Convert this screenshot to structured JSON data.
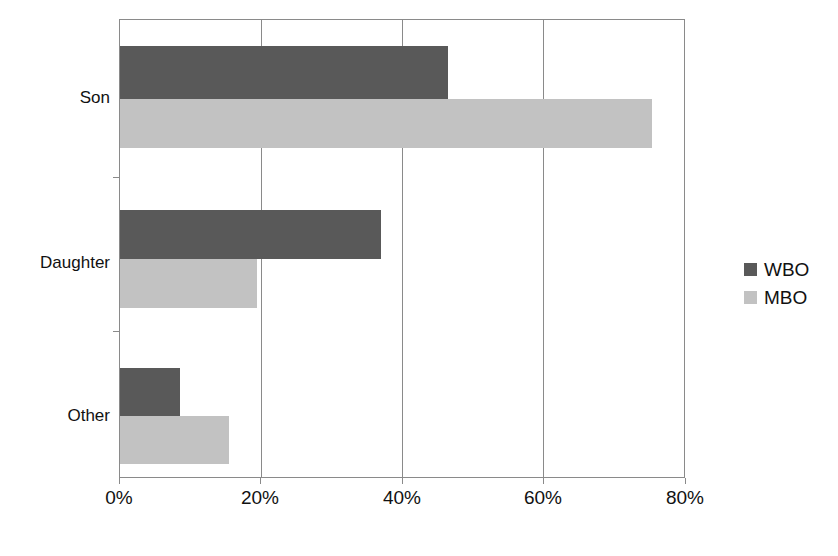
{
  "chart_data": {
    "type": "bar",
    "orientation": "horizontal",
    "title": "",
    "subtitle": "",
    "xlabel": "",
    "ylabel": "",
    "categories": [
      "Son",
      "Daughter",
      "Other"
    ],
    "series": [
      {
        "name": "WBO",
        "color": "#595959",
        "values": [
          46.5,
          37.0,
          8.5
        ]
      },
      {
        "name": "MBO",
        "color": "#c2c2c2",
        "values": [
          75.5,
          19.5,
          15.5
        ]
      }
    ],
    "xticks": [
      "0%",
      "20%",
      "40%",
      "60%",
      "80%"
    ],
    "xtick_values": [
      0,
      20,
      40,
      60,
      80
    ],
    "xlim": [
      0,
      80
    ],
    "grid": "vertical",
    "legend_position": "right",
    "value_suffix": "%"
  },
  "legend": {
    "items": [
      {
        "label": "WBO",
        "swatch": "legend-swatch-wbo"
      },
      {
        "label": "MBO",
        "swatch": "legend-swatch-mbo"
      }
    ]
  },
  "axis": {
    "category_labels": [
      "Son",
      "Daughter",
      "Other"
    ],
    "x_tick_labels": [
      "0%",
      "20%",
      "40%",
      "60%",
      "80%"
    ]
  }
}
